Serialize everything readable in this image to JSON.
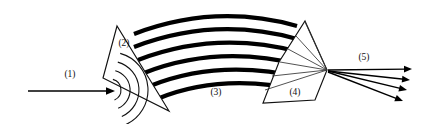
{
  "figure": {
    "title": "",
    "width": 430,
    "height": 124,
    "background_color": "#ffffff",
    "line_color": "#000000"
  },
  "callouts": [
    {
      "id": "1",
      "label": "(1)",
      "x": 70,
      "y": 75,
      "refers_to": "input-beam-arrow"
    },
    {
      "id": "2",
      "label": "(2)",
      "x": 124,
      "y": 44,
      "refers_to": "left-triangle-element"
    },
    {
      "id": "3",
      "label": "(3)",
      "x": 216,
      "y": 93,
      "refers_to": "curved-wavefront-band"
    },
    {
      "id": "4",
      "label": "(4)",
      "x": 295,
      "y": 93,
      "refers_to": "right-triangle-element"
    },
    {
      "id": "5",
      "label": "(5)",
      "x": 364,
      "y": 58,
      "refers_to": "output-beam-arrows"
    }
  ],
  "shapes": {
    "left_triangle": {
      "name": "left-triangle-element",
      "points": "117,26 103,78 169,111",
      "fill": "#ffffff",
      "stroke": "#111111"
    },
    "right_quad": {
      "name": "right-triangle-element",
      "points": "305,21 327,70 315,100 263,103 279,62",
      "fill": "#ffffff",
      "stroke": "#111111"
    }
  },
  "inner_arcs": {
    "name": "diverging-wavefront-arcs",
    "origin_x": 110,
    "origin_y": 90,
    "count": 4,
    "radii": [
      11,
      20,
      29,
      38
    ],
    "stroke_width": 1.1
  },
  "wave_band": {
    "name": "curved-wavefront-band",
    "count": 6,
    "stroke_color": "#000000",
    "stroke_widths": [
      4.2,
      4.2,
      4.2,
      4.2,
      4.2,
      4.2
    ],
    "arcs": [
      "M 134,34 Q 215,3   297,26",
      "M 134,47 Q 215,16  297,39",
      "M 138,60 Q 216,30  299,52",
      "M 144,73 Q 218,44  301,65",
      "M 150,86 Q 220,58  303,78",
      "M 157,99 Q 222,72  305,91"
    ]
  },
  "fan_rays": {
    "name": "converging-ray-fan",
    "focus_x": 327,
    "focus_y": 70,
    "stroke_color": "#333333",
    "origins": [
      {
        "x": 305,
        "y": 22
      },
      {
        "x": 296,
        "y": 36
      },
      {
        "x": 288,
        "y": 49
      },
      {
        "x": 280,
        "y": 62
      },
      {
        "x": 272,
        "y": 76
      },
      {
        "x": 265,
        "y": 90
      }
    ]
  },
  "input_arrow": {
    "name": "input-beam-arrow",
    "x1": 28,
    "y1": 91,
    "x2": 115,
    "y2": 91,
    "direction": "right"
  },
  "output_arrows": {
    "name": "output-beam-arrows",
    "count": 4,
    "focus_x": 327,
    "focus_y": 70,
    "lines": [
      {
        "x1": 328,
        "y1": 70,
        "x2": 412,
        "y2": 69
      },
      {
        "x1": 328,
        "y1": 71,
        "x2": 410,
        "y2": 80
      },
      {
        "x1": 328,
        "y1": 71,
        "x2": 407,
        "y2": 90
      },
      {
        "x1": 328,
        "y1": 72,
        "x2": 403,
        "y2": 101
      }
    ]
  }
}
